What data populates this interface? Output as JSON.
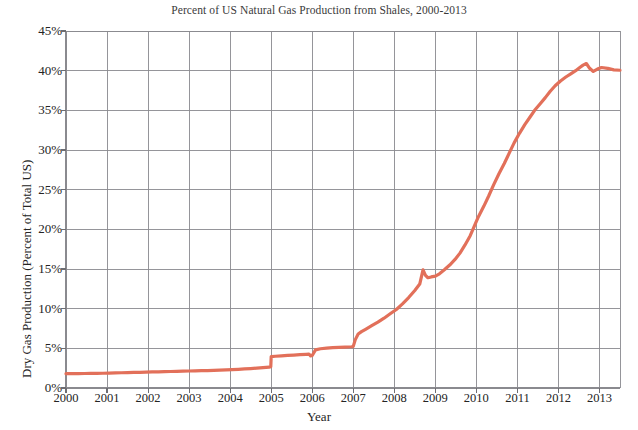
{
  "chart_data": {
    "type": "line",
    "title": "Percent of US Natural Gas Production from Shales, 2000-2013",
    "xlabel": "Year",
    "ylabel": "Dry Gas Production (Percent of Total US)",
    "xlim": [
      2000,
      2013.5
    ],
    "ylim": [
      0,
      45
    ],
    "grid": true,
    "legend": "none",
    "line_color": "#e2705a",
    "line_width": 3.2,
    "grid_color": "#8a8a8f",
    "axis_color": "#6d6d72",
    "x_tick_labels": [
      "2000",
      "2001",
      "2002",
      "2003",
      "2004",
      "2005",
      "2006",
      "2007",
      "2008",
      "2009",
      "2010",
      "2011",
      "2012",
      "2013"
    ],
    "x_tick_values": [
      2000,
      2001,
      2002,
      2003,
      2004,
      2005,
      2006,
      2007,
      2008,
      2009,
      2010,
      2011,
      2012,
      2013
    ],
    "y_tick_labels": [
      "0%",
      "5%",
      "10%",
      "15%",
      "20%",
      "25%",
      "30%",
      "35%",
      "40%",
      "45%"
    ],
    "y_tick_values": [
      0,
      5,
      10,
      15,
      20,
      25,
      30,
      35,
      40,
      45
    ],
    "series": [
      {
        "name": "Shale share of US dry gas production",
        "x": [
          2000.0,
          2000.15,
          2000.3,
          2000.45,
          2000.6,
          2000.75,
          2000.9,
          2001.05,
          2001.2,
          2001.35,
          2001.5,
          2001.65,
          2001.8,
          2001.95,
          2002.1,
          2002.25,
          2002.4,
          2002.55,
          2002.7,
          2002.85,
          2003.0,
          2003.15,
          2003.3,
          2003.45,
          2003.6,
          2003.75,
          2003.9,
          2004.05,
          2004.2,
          2004.35,
          2004.5,
          2004.65,
          2004.8,
          2004.95,
          2004.99,
          2005.0,
          2005.1,
          2005.25,
          2005.4,
          2005.55,
          2005.7,
          2005.85,
          2005.92,
          2005.96,
          2006.0,
          2006.08,
          2006.2,
          2006.35,
          2006.5,
          2006.65,
          2006.8,
          2006.95,
          2006.99,
          2007.0,
          2007.05,
          2007.12,
          2007.2,
          2007.3,
          2007.45,
          2007.6,
          2007.75,
          2007.9,
          2008.05,
          2008.2,
          2008.35,
          2008.5,
          2008.62,
          2008.7,
          2008.76,
          2008.82,
          2008.9,
          2009.0,
          2009.1,
          2009.22,
          2009.35,
          2009.48,
          2009.6,
          2009.72,
          2009.85,
          2009.95,
          2010.05,
          2010.18,
          2010.3,
          2010.42,
          2010.55,
          2010.68,
          2010.8,
          2010.92,
          2011.05,
          2011.18,
          2011.3,
          2011.42,
          2011.55,
          2011.68,
          2011.8,
          2011.92,
          2012.05,
          2012.18,
          2012.3,
          2012.42,
          2012.52,
          2012.6,
          2012.68,
          2012.76,
          2012.85,
          2012.95,
          2013.05,
          2013.2,
          2013.35,
          2013.5
        ],
        "y": [
          1.8,
          1.81,
          1.82,
          1.83,
          1.84,
          1.85,
          1.86,
          1.88,
          1.9,
          1.92,
          1.94,
          1.96,
          1.98,
          2.0,
          2.02,
          2.04,
          2.06,
          2.08,
          2.1,
          2.12,
          2.14,
          2.16,
          2.18,
          2.2,
          2.22,
          2.25,
          2.28,
          2.32,
          2.36,
          2.4,
          2.45,
          2.5,
          2.56,
          2.62,
          2.68,
          3.95,
          4.0,
          4.05,
          4.1,
          4.15,
          4.2,
          4.25,
          4.28,
          4.05,
          4.1,
          4.8,
          4.95,
          5.02,
          5.08,
          5.12,
          5.16,
          5.2,
          5.22,
          5.25,
          6.1,
          6.8,
          7.1,
          7.4,
          7.85,
          8.3,
          8.8,
          9.35,
          9.9,
          10.6,
          11.4,
          12.3,
          13.1,
          14.9,
          14.2,
          13.9,
          14.0,
          14.1,
          14.4,
          14.9,
          15.5,
          16.2,
          17.0,
          18.0,
          19.2,
          20.4,
          21.6,
          22.9,
          24.2,
          25.6,
          27.0,
          28.3,
          29.6,
          30.9,
          32.1,
          33.2,
          34.1,
          35.0,
          35.8,
          36.6,
          37.4,
          38.1,
          38.7,
          39.2,
          39.6,
          40.0,
          40.4,
          40.7,
          40.9,
          40.3,
          39.9,
          40.2,
          40.4,
          40.3,
          40.1,
          40.05
        ]
      }
    ]
  },
  "axes": {
    "plot_left_px": 66,
    "plot_right_px": 620,
    "plot_top_px": 31,
    "plot_bottom_px": 388
  }
}
